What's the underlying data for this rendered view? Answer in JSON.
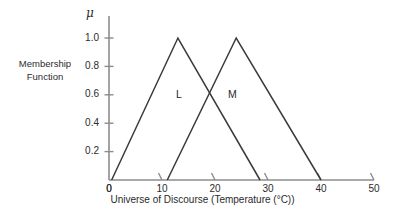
{
  "figure": {
    "y_axis_symbol": "μ",
    "y_axis_title": "Membership\nFunction",
    "x_axis_title": "Universe of Discourse (Temperature (°C))",
    "origin_label": "0"
  },
  "chart_data": {
    "type": "line",
    "title": "",
    "subtitle": "",
    "xlabel": "Universe of Discourse (Temperature (°C))",
    "ylabel": "μ",
    "ylabel_long": "Membership Function",
    "xlim": [
      0,
      50
    ],
    "ylim": [
      0,
      1.08
    ],
    "grid": false,
    "legend": "inline-annotations",
    "x_ticks": [
      0,
      10,
      20,
      30,
      40,
      50
    ],
    "x_tick_labels": [
      "0",
      "10",
      "20",
      "30",
      "40",
      "50"
    ],
    "y_ticks": [
      0.2,
      0.4,
      0.6,
      0.8,
      1.0
    ],
    "y_tick_labels": [
      "0.2",
      "0.4",
      "0.6",
      "0.8",
      "1.0"
    ],
    "series": [
      {
        "name": "L",
        "shape": "triangular",
        "x": [
          0.5,
          13.0,
          28.5
        ],
        "values": [
          0.0,
          1.0,
          0.0
        ],
        "label": "L",
        "label_x": 13.2,
        "label_y": 0.6
      },
      {
        "name": "M",
        "shape": "triangular",
        "x": [
          11.0,
          24.0,
          40.0
        ],
        "values": [
          0.0,
          1.0,
          0.0
        ],
        "label": "M",
        "label_x": 23.0,
        "label_y": 0.6
      }
    ],
    "annotations": [
      {
        "text": "L",
        "x": 13.2,
        "y": 0.6
      },
      {
        "text": "M",
        "x": 23.0,
        "y": 0.6
      }
    ],
    "colors": {
      "axis": "#8c8c8c",
      "curve": "#3a3a3a",
      "text": "#2b2b2b",
      "background": "#ffffff"
    }
  }
}
